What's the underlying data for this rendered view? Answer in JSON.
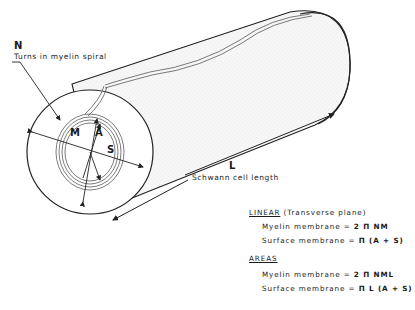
{
  "figure": {
    "labels": {
      "n_symbol": "N",
      "n_caption": "Turns in myelin spiral",
      "m_symbol": "M",
      "a_symbol": "A",
      "s_symbol": "S",
      "l_symbol": "L",
      "l_caption": "Schwann cell length"
    },
    "colors": {
      "line": "#222222",
      "shade": "#ececec",
      "background": "#ffffff"
    }
  },
  "formulas": {
    "linear": {
      "header": "LINEAR",
      "subheader": "(Transverse plane)",
      "rows": [
        {
          "label": "Myelin membrane =",
          "expr": "2 Π NM"
        },
        {
          "label": "Surface membrane =",
          "expr": "Π (A + S)"
        }
      ]
    },
    "areas": {
      "header": "AREAS",
      "rows": [
        {
          "label": "Myelin membrane =",
          "expr": "2 Π NML"
        },
        {
          "label": "Surface membrane =",
          "expr": "Π L (A + S)"
        }
      ]
    }
  }
}
